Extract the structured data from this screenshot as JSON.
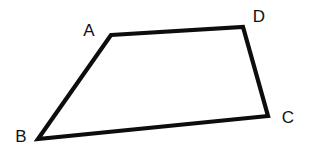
{
  "figure": {
    "kind": "quadrilateral-diagram",
    "canvas": {
      "width": 309,
      "height": 154,
      "background": "#ffffff"
    },
    "stroke": {
      "color": "#0d0d0d",
      "width": 4.2,
      "linejoin": "miter",
      "linecap": "butt"
    },
    "fill": "#ffffff",
    "polygon_order": [
      "A",
      "D",
      "C",
      "B"
    ],
    "vertices": [
      {
        "id": "A",
        "label": "A",
        "x": 111,
        "y": 35,
        "label_x": 89,
        "label_y": 30
      },
      {
        "id": "D",
        "label": "D",
        "x": 243,
        "y": 27,
        "label_x": 259,
        "label_y": 16
      },
      {
        "id": "C",
        "label": "C",
        "x": 268,
        "y": 116,
        "label_x": 288,
        "label_y": 117
      },
      {
        "id": "B",
        "label": "B",
        "x": 38,
        "y": 139,
        "label_x": 21,
        "label_y": 136
      }
    ],
    "edges": [
      {
        "id": "AD",
        "from": "A",
        "to": "D"
      },
      {
        "id": "DC",
        "from": "D",
        "to": "C"
      },
      {
        "id": "CB",
        "from": "C",
        "to": "B"
      },
      {
        "id": "BA",
        "from": "B",
        "to": "A"
      }
    ],
    "label_font_size_px": 17,
    "label_color": "#111111"
  }
}
